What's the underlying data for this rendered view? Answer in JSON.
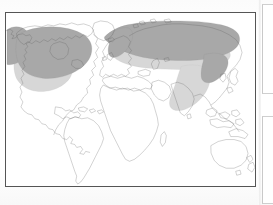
{
  "page": {
    "kind": "scanned-book-page",
    "background_color": "#fdfdfd"
  },
  "map": {
    "title": "",
    "projection_note": "",
    "frame": {
      "border_color": "#555555",
      "fill_color": "#ffffff",
      "x": 5,
      "y": 12,
      "width": 251,
      "height": 175
    },
    "coastline_color": "#5a5a5a",
    "legend_present": false,
    "graticule_present": false
  },
  "zones": [
    {
      "id": "boreal",
      "label": "dark-shaded northern zone",
      "color": "#a8a8a8",
      "regions": [
        "Alaska",
        "Canada",
        "Scandinavia",
        "Northern Russia",
        "Siberia",
        "Manchuria"
      ]
    },
    {
      "id": "temperate",
      "label": "light-shaded mid-latitude zone",
      "color": "#d7d7d7",
      "regions": [
        "Northern United States",
        "Central Europe",
        "Eastern Europe",
        "Central Asia",
        "Eastern China",
        "Korea"
      ]
    }
  ],
  "continents": [
    {
      "name": "North America",
      "shaded": true
    },
    {
      "name": "South America",
      "shaded": false
    },
    {
      "name": "Greenland",
      "shaded": false
    },
    {
      "name": "Europe",
      "shaded": true
    },
    {
      "name": "Africa",
      "shaded": false
    },
    {
      "name": "Asia",
      "shaded": true
    },
    {
      "name": "Australia",
      "shaded": false
    },
    {
      "name": "New Zealand",
      "shaded": false
    }
  ],
  "page_fragments": [
    {
      "id": "fragment-top",
      "label": "adjacent page panel upper"
    },
    {
      "id": "fragment-bottom",
      "label": "adjacent page panel lower"
    }
  ]
}
